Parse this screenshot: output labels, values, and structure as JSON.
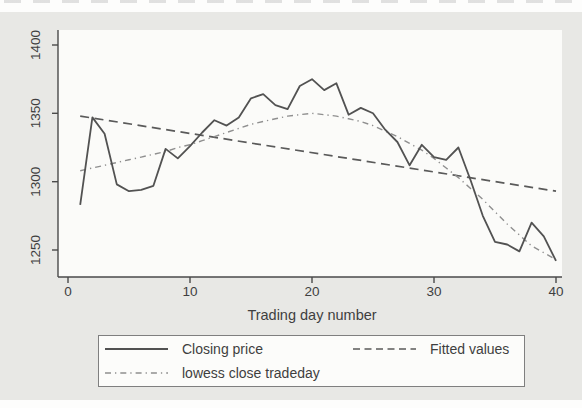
{
  "page": {
    "background_color": "#e8e8e5",
    "plot_background_color": "#fbfbf9",
    "text_color": "#3f3f3f"
  },
  "chart_data": {
    "type": "line",
    "title": "",
    "xlabel": "Trading day number",
    "ylabel": "",
    "xlim": [
      0,
      40.5
    ],
    "ylim": [
      1230,
      1412
    ],
    "grid": false,
    "legend_position": "bottom",
    "x_ticks": [
      "0",
      "10",
      "20",
      "30",
      "40"
    ],
    "y_ticks": [
      "1250",
      "1300",
      "1350",
      "1400"
    ],
    "x": [
      1,
      2,
      3,
      4,
      5,
      6,
      7,
      8,
      9,
      10,
      11,
      12,
      13,
      14,
      15,
      16,
      17,
      18,
      19,
      20,
      21,
      22,
      23,
      24,
      25,
      26,
      27,
      28,
      29,
      30,
      31,
      32,
      33,
      34,
      35,
      36,
      37,
      38,
      39,
      40
    ],
    "series": [
      {
        "name": "Closing price",
        "style": "solid",
        "color": "#525252",
        "values": [
          1283,
          1347,
          1335,
          1298,
          1293,
          1294,
          1297,
          1324,
          1317,
          1326,
          1336,
          1345,
          1341,
          1347,
          1361,
          1364,
          1356,
          1353,
          1370,
          1375,
          1367,
          1372,
          1349,
          1354,
          1350,
          1338,
          1329,
          1312,
          1327,
          1318,
          1316,
          1325,
          1301,
          1275,
          1256,
          1254,
          1249,
          1270,
          1260,
          1242
        ]
      },
      {
        "name": "lowess close tradeday",
        "style": "dash-dot",
        "color": "#8f8f8f",
        "values": [
          1308,
          1310,
          1312,
          1314,
          1316,
          1318,
          1320,
          1322,
          1325,
          1327,
          1330,
          1333,
          1336,
          1339,
          1342,
          1344,
          1346,
          1348,
          1349,
          1350,
          1349,
          1348,
          1346,
          1344,
          1341,
          1337,
          1333,
          1328,
          1323,
          1317,
          1310,
          1303,
          1295,
          1287,
          1278,
          1269,
          1261,
          1253,
          1248,
          1243
        ]
      },
      {
        "name": "Fitted values",
        "style": "dashed",
        "color": "#5a5a5a",
        "x": [
          1,
          40
        ],
        "values": [
          1348,
          1293
        ]
      }
    ]
  }
}
